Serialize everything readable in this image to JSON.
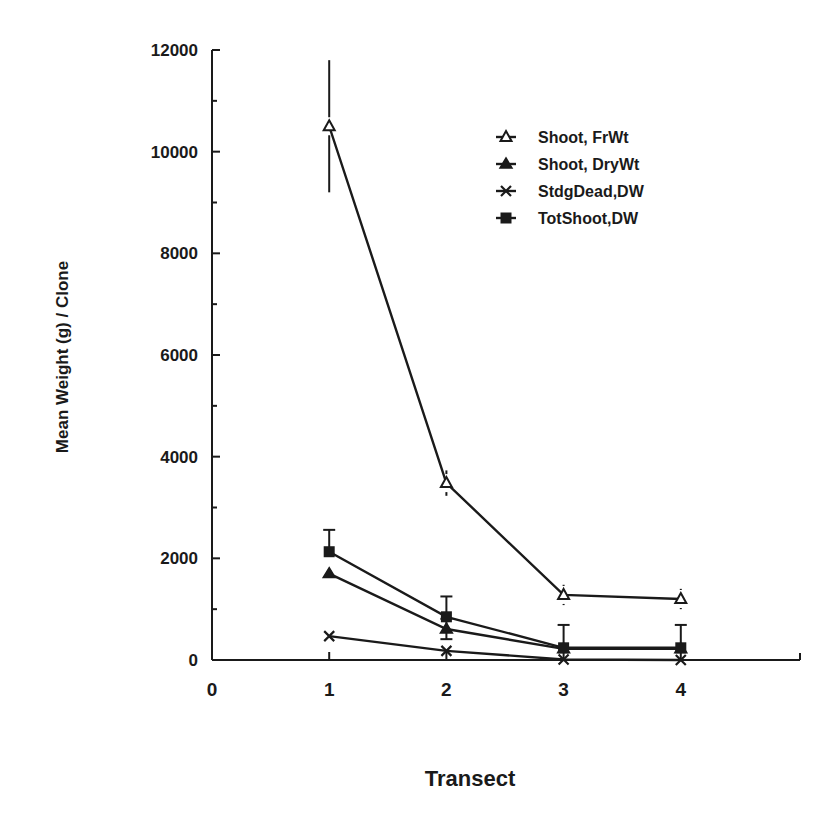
{
  "chart_data": {
    "type": "line",
    "title": "",
    "xlabel": "Transect",
    "ylabel": "Mean Weight (g) / Clone",
    "x": [
      1,
      2,
      3,
      4
    ],
    "xticks": [
      0,
      1,
      2,
      3,
      4
    ],
    "yticks": [
      0,
      2000,
      4000,
      6000,
      8000,
      10000,
      12000
    ],
    "xlim": [
      0,
      5
    ],
    "ylim": [
      0,
      12000
    ],
    "grid": false,
    "legend_position": "upper right",
    "series": [
      {
        "name": "Shoot, FrWt",
        "marker": "open-triangle",
        "values": [
          10500,
          3480,
          1280,
          1200
        ],
        "errors": [
          1300,
          250,
          200,
          200
        ]
      },
      {
        "name": "Shoot, DryWt",
        "marker": "filled-triangle",
        "values": [
          1700,
          610,
          220,
          220
        ],
        "errors": [
          0,
          200,
          0,
          0
        ]
      },
      {
        "name": "StdgDead,DW",
        "marker": "x",
        "values": [
          470,
          180,
          10,
          0
        ],
        "errors": [
          0,
          0,
          0,
          0
        ]
      },
      {
        "name": "TotShoot,DW",
        "marker": "filled-square",
        "values": [
          2130,
          850,
          240,
          240
        ],
        "errors": [
          430,
          400,
          450,
          450
        ]
      }
    ]
  }
}
